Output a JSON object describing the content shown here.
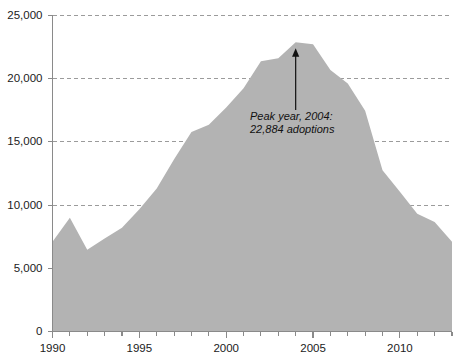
{
  "chart_data": {
    "type": "area",
    "title": "",
    "xlabel": "",
    "ylabel": "",
    "xlim": [
      1990,
      2013
    ],
    "ylim": [
      0,
      25000
    ],
    "grid": true,
    "legend": null,
    "series_name": "adoptions",
    "fill_color": "#b3b3b3",
    "x": [
      1990,
      1991,
      1992,
      1993,
      1994,
      1995,
      1996,
      1997,
      1998,
      1999,
      2000,
      2001,
      2002,
      2003,
      2004,
      2005,
      2006,
      2007,
      2008,
      2009,
      2010,
      2011,
      2012,
      2013
    ],
    "values": [
      7093,
      9008,
      6472,
      7348,
      8200,
      9679,
      11316,
      13621,
      15774,
      16363,
      17718,
      19237,
      21378,
      21616,
      22884,
      22728,
      20679,
      19613,
      17456,
      12753,
      11059,
      9320,
      8668,
      7094
    ],
    "y_ticks": [
      0,
      5000,
      10000,
      15000,
      20000,
      25000
    ],
    "y_tick_labels": [
      "0",
      "5,000",
      "10,000",
      "15,000",
      "20,000",
      "25,000"
    ],
    "x_ticks_major": [
      1990,
      1995,
      2000,
      2005,
      2010
    ],
    "x_tick_labels": [
      "1990",
      "1995",
      "2000",
      "2005",
      "2010"
    ],
    "x_ticks_minor": [
      1991,
      1992,
      1993,
      1994,
      1996,
      1997,
      1998,
      1999,
      2001,
      2002,
      2003,
      2004,
      2006,
      2007,
      2008,
      2009,
      2011,
      2012,
      2013
    ],
    "annotations": [
      {
        "line1": "Peak year, 2004:",
        "line2": "22,884 adoptions",
        "target_x": 2004,
        "target_y": 22884
      }
    ]
  }
}
